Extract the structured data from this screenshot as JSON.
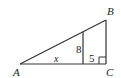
{
  "diagram": {
    "type": "right-triangle",
    "vertices": {
      "A": {
        "label": "A"
      },
      "B": {
        "label": "B"
      },
      "C": {
        "label": "C"
      }
    },
    "segments": {
      "inner_vertical": {
        "label": "8"
      },
      "base_left": {
        "label": "x"
      },
      "base_right": {
        "label": "5"
      }
    },
    "right_angle_at": "C",
    "line_color": "#333333"
  }
}
